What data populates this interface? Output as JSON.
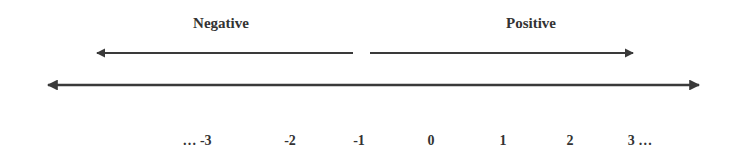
{
  "diagram": {
    "type": "number_line",
    "headings": {
      "negative": "Negative",
      "positive": "Positive"
    },
    "direction_arrows": [
      {
        "name": "negative-direction-arrow",
        "direction": "left",
        "label": "Negative"
      },
      {
        "name": "positive-direction-arrow",
        "direction": "right",
        "label": "Positive"
      }
    ],
    "number_line": {
      "arrows": "both-ends"
    },
    "tick_labels": [
      "… -3",
      "-2",
      "-1",
      "0",
      "1",
      "2",
      "3 …"
    ],
    "colors": {
      "line": "#3a3a3a",
      "text": "#333333",
      "background": "#ffffff"
    }
  }
}
